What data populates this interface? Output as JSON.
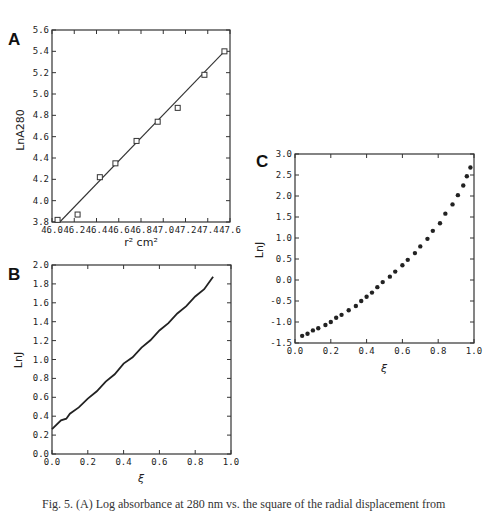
{
  "chart_data": [
    {
      "id": "A",
      "type": "scatter",
      "panel_label": "A",
      "title": "",
      "xlabel": "r² cm²",
      "ylabel": "LnA280",
      "xlim": [
        46.0,
        47.6
      ],
      "ylim": [
        3.8,
        5.6
      ],
      "xticks": [
        "46.0",
        "46.2",
        "46.4",
        "46.6",
        "46.8",
        "47.0",
        "47.2",
        "47.4",
        "47.6"
      ],
      "yticks": [
        "3.8",
        "4.0",
        "4.2",
        "4.4",
        "4.6",
        "4.8",
        "5.0",
        "5.2",
        "5.4",
        "5.6"
      ],
      "marker": "open-square",
      "points": [
        {
          "x": 46.05,
          "y": 3.82
        },
        {
          "x": 46.23,
          "y": 3.87
        },
        {
          "x": 46.43,
          "y": 4.22
        },
        {
          "x": 46.57,
          "y": 4.35
        },
        {
          "x": 46.76,
          "y": 4.56
        },
        {
          "x": 46.95,
          "y": 4.74
        },
        {
          "x": 47.13,
          "y": 4.87
        },
        {
          "x": 47.37,
          "y": 5.18
        },
        {
          "x": 47.55,
          "y": 5.4
        }
      ],
      "fit_line": [
        {
          "x": 46.07,
          "y": 3.8
        },
        {
          "x": 47.55,
          "y": 5.4
        }
      ]
    },
    {
      "id": "B",
      "type": "line",
      "panel_label": "B",
      "title": "",
      "xlabel": "ξ",
      "ylabel": "LnJ",
      "xlim": [
        0.0,
        1.0
      ],
      "ylim": [
        0.0,
        2.0
      ],
      "xticks": [
        "0.0",
        "0.2",
        "0.4",
        "0.6",
        "0.8",
        "1.0"
      ],
      "yticks": [
        "0.0",
        "0.2",
        "0.4",
        "0.6",
        "0.8",
        "1.0",
        "1.2",
        "1.4",
        "1.6",
        "1.8",
        "2.0"
      ],
      "series": [
        {
          "name": "LnJ",
          "x": [
            0.0,
            0.05,
            0.08,
            0.1,
            0.15,
            0.2,
            0.25,
            0.3,
            0.35,
            0.4,
            0.45,
            0.5,
            0.55,
            0.6,
            0.65,
            0.7,
            0.75,
            0.8,
            0.85,
            0.9
          ],
          "y": [
            0.27,
            0.35,
            0.38,
            0.42,
            0.5,
            0.58,
            0.67,
            0.76,
            0.85,
            0.95,
            1.03,
            1.12,
            1.21,
            1.3,
            1.39,
            1.48,
            1.57,
            1.66,
            1.75,
            1.87
          ]
        }
      ]
    },
    {
      "id": "C",
      "type": "scatter",
      "panel_label": "C",
      "title": "",
      "xlabel": "ξ",
      "ylabel": "LnJ",
      "xlim": [
        0.0,
        1.0
      ],
      "ylim": [
        -1.5,
        3.0
      ],
      "xticks": [
        "0.0",
        "0.2",
        "0.4",
        "0.6",
        "0.8",
        "1.0"
      ],
      "yticks": [
        "-1.5",
        "-1.0",
        "-0.5",
        "0.0",
        "0.5",
        "1.0",
        "1.5",
        "2.0",
        "2.5",
        "3.0"
      ],
      "marker": "filled-circle",
      "points": [
        {
          "x": 0.04,
          "y": -1.33
        },
        {
          "x": 0.07,
          "y": -1.28
        },
        {
          "x": 0.1,
          "y": -1.2
        },
        {
          "x": 0.13,
          "y": -1.15
        },
        {
          "x": 0.17,
          "y": -1.07
        },
        {
          "x": 0.2,
          "y": -1.0
        },
        {
          "x": 0.23,
          "y": -0.9
        },
        {
          "x": 0.26,
          "y": -0.83
        },
        {
          "x": 0.3,
          "y": -0.72
        },
        {
          "x": 0.34,
          "y": -0.62
        },
        {
          "x": 0.37,
          "y": -0.5
        },
        {
          "x": 0.4,
          "y": -0.4
        },
        {
          "x": 0.43,
          "y": -0.3
        },
        {
          "x": 0.46,
          "y": -0.17
        },
        {
          "x": 0.49,
          "y": -0.05
        },
        {
          "x": 0.53,
          "y": 0.08
        },
        {
          "x": 0.56,
          "y": 0.2
        },
        {
          "x": 0.6,
          "y": 0.35
        },
        {
          "x": 0.63,
          "y": 0.48
        },
        {
          "x": 0.67,
          "y": 0.64
        },
        {
          "x": 0.7,
          "y": 0.8
        },
        {
          "x": 0.74,
          "y": 0.98
        },
        {
          "x": 0.77,
          "y": 1.17
        },
        {
          "x": 0.81,
          "y": 1.35
        },
        {
          "x": 0.84,
          "y": 1.58
        },
        {
          "x": 0.88,
          "y": 1.8
        },
        {
          "x": 0.91,
          "y": 2.02
        },
        {
          "x": 0.94,
          "y": 2.25
        },
        {
          "x": 0.96,
          "y": 2.47
        },
        {
          "x": 0.98,
          "y": 2.68
        }
      ]
    }
  ],
  "caption": "Fig. 5. (A) Log absorbance at 280 nm vs. the square of the radial displacement from"
}
